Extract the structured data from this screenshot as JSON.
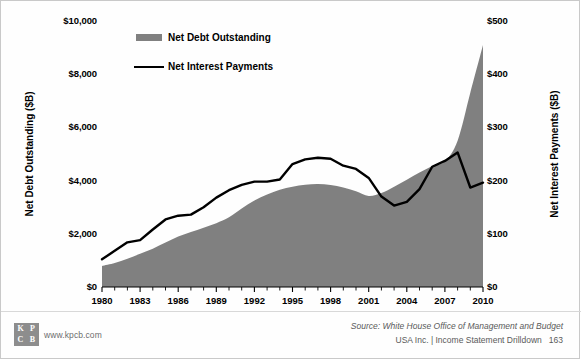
{
  "chart_data": {
    "type": "area",
    "title": "",
    "xlabel": "",
    "x": [
      1980,
      1981,
      1982,
      1983,
      1984,
      1985,
      1986,
      1987,
      1988,
      1989,
      1990,
      1991,
      1992,
      1993,
      1994,
      1995,
      1996,
      1997,
      1998,
      1999,
      2000,
      2001,
      2002,
      2003,
      2004,
      2005,
      2006,
      2007,
      2008,
      2009,
      2010
    ],
    "xlim": [
      1980,
      2010
    ],
    "xticks": [
      1980,
      1983,
      1986,
      1989,
      1992,
      1995,
      1998,
      2001,
      2004,
      2007,
      2010
    ],
    "xticklabels": [
      "1980",
      "1983",
      "1986",
      "1989",
      "1992",
      "1995",
      "1998",
      "2001",
      "2004",
      "2007",
      "2010"
    ],
    "minor_xticks_every": 1,
    "grid": false,
    "legend_position": "top-left-inside",
    "axes": [
      {
        "side": "left",
        "ylabel": "Net Debt Outstanding ($B)",
        "ylim": [
          0,
          10000
        ],
        "yticks": [
          0,
          2000,
          4000,
          6000,
          8000,
          10000
        ],
        "yticklabels": [
          "$0",
          "$2,000",
          "$4,000",
          "$6,000",
          "$8,000",
          "$10,000"
        ]
      },
      {
        "side": "right",
        "ylabel": "Net Interest Payments ($B)",
        "ylim": [
          0,
          500
        ],
        "yticks": [
          0,
          100,
          200,
          300,
          400,
          500
        ],
        "yticklabels": [
          "$0",
          "$100",
          "$200",
          "$300",
          "$400",
          "$500"
        ]
      }
    ],
    "series": [
      {
        "name": "Net Debt Outstanding",
        "type": "area",
        "axis": "left",
        "color": "#808080",
        "units": "$B",
        "values": [
          790,
          900,
          1060,
          1250,
          1440,
          1670,
          1900,
          2070,
          2230,
          2400,
          2620,
          2950,
          3250,
          3480,
          3660,
          3770,
          3840,
          3870,
          3830,
          3740,
          3600,
          3420,
          3530,
          3770,
          4030,
          4300,
          4550,
          4720,
          5500,
          7300,
          9100
        ]
      },
      {
        "name": "Net Interest Payments",
        "type": "line",
        "axis": "right",
        "color": "#000000",
        "units": "$B",
        "values": [
          52,
          68,
          84,
          88,
          108,
          127,
          134,
          136,
          150,
          168,
          182,
          192,
          198,
          198,
          202,
          231,
          240,
          243,
          241,
          228,
          222,
          205,
          170,
          153,
          160,
          184,
          226,
          237,
          253,
          187,
          196
        ]
      }
    ]
  },
  "legend": {
    "items": [
      {
        "label": "Net Debt Outstanding",
        "marker": "area-swatch"
      },
      {
        "label": "Net Interest Payments",
        "marker": "line-swatch"
      }
    ]
  },
  "footer": {
    "logo": {
      "name": "kpcb-logo",
      "letters": [
        "K",
        "P",
        "C",
        "B"
      ]
    },
    "url": "www.kpcb.com",
    "source": "Source: White House Office of Management and Budget",
    "deck": "USA Inc. | Income Statement Drilldown",
    "page_number": "163"
  }
}
